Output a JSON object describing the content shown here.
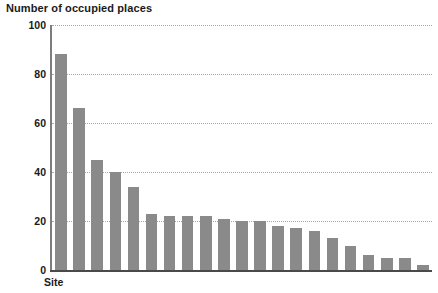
{
  "chart_data": {
    "type": "bar",
    "title": "Number of occupied places",
    "xlabel": "Site",
    "ylabel": "Number of occupied places",
    "ylim": [
      0,
      100
    ],
    "yticks": [
      0,
      20,
      40,
      60,
      80,
      100
    ],
    "ytick_labels": [
      "0",
      "20",
      "40",
      "60",
      "80",
      "100"
    ],
    "grid": true,
    "legend": "none",
    "categories": [
      "1",
      "2",
      "3",
      "4",
      "5",
      "6",
      "7",
      "8",
      "9",
      "10",
      "11",
      "12",
      "13",
      "14",
      "15",
      "16",
      "17",
      "18",
      "19",
      "20",
      "21"
    ],
    "values": [
      88,
      66,
      45,
      40,
      34,
      23,
      22,
      22,
      22,
      21,
      20,
      20,
      18,
      17,
      16,
      13,
      10,
      6,
      5,
      5,
      2
    ],
    "bar_color": "#8a8a8a",
    "gridline_color": "#a8a8a8",
    "axis_color": "#4a4a4a",
    "text_color": "#1a1a1a",
    "background": "#ffffff"
  }
}
